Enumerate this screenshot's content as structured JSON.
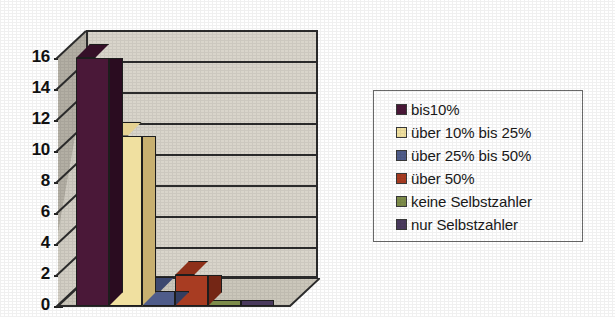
{
  "chart_data": {
    "type": "bar",
    "title": "",
    "subtitle": "",
    "xlabel": "",
    "ylabel": "",
    "ylim": [
      0,
      16
    ],
    "ytick_step": 2,
    "yticks": [
      "16",
      "14",
      "12",
      "10",
      "8",
      "6",
      "4",
      "2",
      "0"
    ],
    "grid": true,
    "grid_axis": "y",
    "legend_position": "right",
    "three_d": true,
    "categories": [
      "bis10%",
      "über 10% bis 25%",
      "über 25% bis 50%",
      "über 50%",
      "keine Selbstzahler",
      "nur Selbstzahler"
    ],
    "values": [
      16,
      11,
      1,
      2,
      0,
      0
    ],
    "series": [
      {
        "name": "Anzahl",
        "values": [
          16,
          11,
          1,
          2,
          0,
          0
        ]
      }
    ],
    "colors": [
      "#4a1838",
      "#f0e0a0",
      "#4f5c8a",
      "#a83c22",
      "#7d8c4a",
      "#4a3a5e"
    ],
    "bar_top_colors": [
      "#351028",
      "#e6d292",
      "#3c4870",
      "#8e3019",
      "#6b7a3d",
      "#3b2e4c"
    ],
    "bar_side_colors": [
      "#2a0c20",
      "#c8b070",
      "#333d60",
      "#742615",
      "#586432",
      "#30263f"
    ]
  },
  "legend": {
    "items": [
      {
        "label": "bis10%",
        "color": "#4a1838"
      },
      {
        "label": "über 10% bis 25%",
        "color": "#f0e0a0"
      },
      {
        "label": "über 25% bis 50%",
        "color": "#4f5c8a"
      },
      {
        "label": "über 50%",
        "color": "#a83c22"
      },
      {
        "label": "keine Selbstzahler",
        "color": "#7d8c4a"
      },
      {
        "label": "nur Selbstzahler",
        "color": "#4a3a5e"
      }
    ]
  },
  "axis": {
    "y_labels": [
      "16",
      "14",
      "12",
      "10",
      "8",
      "6",
      "4",
      "2",
      "0"
    ]
  },
  "theme": {
    "wall_color": "#d9d5cb",
    "side_wall_color": "#b3afa4",
    "floor_color": "#cbc7bb",
    "line_color": "#2c2c2c",
    "background": "#ffffff"
  }
}
